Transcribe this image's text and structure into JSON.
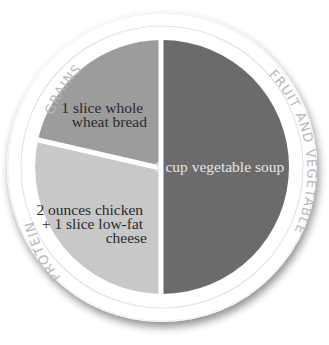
{
  "diagram": {
    "type": "plate",
    "sections": [
      {
        "id": "grains",
        "label": "GRAINS",
        "food_lines": [
          "1 slice whole",
          "wheat bread"
        ],
        "color": "#9c9c9c"
      },
      {
        "id": "protein",
        "label": "PROTEIN",
        "food_lines": [
          "2 ounces chicken",
          "+ 1 slice low-fat",
          "cheese"
        ],
        "color": "#c8c8c8"
      },
      {
        "id": "fruit-vegetable",
        "label": "FRUIT AND VEGETABLE",
        "food_lines": [
          "1 cup vegetable soup"
        ],
        "color": "#6b6b6b"
      }
    ],
    "colors": {
      "plate_rim": "#ffffff",
      "rim_line": "#e2e2e2",
      "rim_label": "#b8b8b8",
      "shadow": "#9a9a9a",
      "divider": "#ffffff"
    }
  }
}
